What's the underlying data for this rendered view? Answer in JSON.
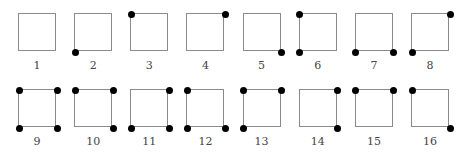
{
  "diagram": {
    "title": "",
    "corner_order": [
      "tl",
      "tr",
      "bl",
      "br"
    ],
    "items": [
      {
        "label": "1",
        "row": 0,
        "col": 0,
        "dots": []
      },
      {
        "label": "2",
        "row": 0,
        "col": 1,
        "dots": [
          "bl"
        ]
      },
      {
        "label": "3",
        "row": 0,
        "col": 2,
        "dots": [
          "tl"
        ]
      },
      {
        "label": "4",
        "row": 0,
        "col": 3,
        "dots": [
          "tr"
        ]
      },
      {
        "label": "5",
        "row": 0,
        "col": 4,
        "dots": [
          "br"
        ]
      },
      {
        "label": "6",
        "row": 0,
        "col": 5,
        "dots": [
          "tl",
          "bl"
        ]
      },
      {
        "label": "7",
        "row": 0,
        "col": 6,
        "dots": [
          "bl",
          "br"
        ]
      },
      {
        "label": "8",
        "row": 0,
        "col": 7,
        "dots": [
          "tr",
          "bl"
        ]
      },
      {
        "label": "9",
        "row": 1,
        "col": 0,
        "dots": [
          "tl",
          "tr",
          "bl",
          "br"
        ]
      },
      {
        "label": "10",
        "row": 1,
        "col": 1,
        "dots": [
          "tl",
          "tr",
          "br"
        ]
      },
      {
        "label": "11",
        "row": 1,
        "col": 2,
        "dots": [
          "tr",
          "bl",
          "br"
        ]
      },
      {
        "label": "12",
        "row": 1,
        "col": 3,
        "dots": [
          "tl",
          "bl",
          "br"
        ]
      },
      {
        "label": "13",
        "row": 1,
        "col": 4,
        "dots": [
          "tl",
          "tr",
          "bl"
        ]
      },
      {
        "label": "14",
        "row": 1,
        "col": 5,
        "dots": [
          "tr",
          "br"
        ]
      },
      {
        "label": "15",
        "row": 1,
        "col": 6,
        "dots": [
          "tl",
          "tr"
        ]
      },
      {
        "label": "16",
        "row": 1,
        "col": 7,
        "dots": [
          "tl",
          "br"
        ]
      }
    ]
  },
  "colors": {
    "square_stroke": "#8a8a8a",
    "dot_fill": "#000000",
    "label_text": "#444444",
    "background": "#ffffff"
  }
}
